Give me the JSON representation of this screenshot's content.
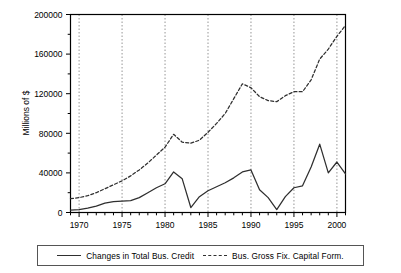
{
  "chart_data": {
    "type": "line",
    "title": "",
    "xlabel": "",
    "ylabel": "Millions of $",
    "xlim": [
      1969,
      2001
    ],
    "ylim": [
      0,
      200000
    ],
    "xticks": [
      1970,
      1975,
      1980,
      1985,
      1990,
      1995,
      2000
    ],
    "yticks": [
      0,
      40000,
      80000,
      120000,
      160000,
      200000
    ],
    "ytick_labels": [
      "0",
      "40000",
      "80000",
      "120000",
      "160000",
      "200000"
    ],
    "xtick_labels": [
      "1970",
      "1975",
      "1980",
      "1985",
      "1990",
      "1995",
      "2000"
    ],
    "grid": "vertical dotted gridlines at each x tick",
    "legend_position": "below axes, boxed, horizontal",
    "x": [
      1969,
      1970,
      1971,
      1972,
      1973,
      1974,
      1975,
      1976,
      1977,
      1978,
      1979,
      1980,
      1981,
      1982,
      1983,
      1984,
      1985,
      1986,
      1987,
      1988,
      1989,
      1990,
      1991,
      1992,
      1993,
      1994,
      1995,
      1996,
      1997,
      1998,
      1999,
      2000,
      2001
    ],
    "series": [
      {
        "name": "Changes in Total Bus. Credit",
        "style": "solid",
        "color": "#2f2f2f",
        "values": [
          2500,
          3000,
          4500,
          6500,
          9500,
          11000,
          11500,
          12000,
          15000,
          20000,
          25000,
          29000,
          41000,
          34000,
          5000,
          16000,
          22000,
          26000,
          30000,
          35000,
          41000,
          43000,
          23000,
          15000,
          3000,
          16000,
          25000,
          27000,
          46000,
          69000,
          40000,
          51000,
          39000
        ]
      },
      {
        "name": "Bus. Gross Fix. Capital Form.",
        "style": "dashed",
        "color": "#2f2f2f",
        "values": [
          14000,
          15000,
          17000,
          20000,
          24000,
          28000,
          32000,
          37000,
          43000,
          50000,
          58000,
          66000,
          79000,
          71000,
          70000,
          73000,
          81000,
          90000,
          100000,
          115000,
          130000,
          126000,
          117000,
          113000,
          112000,
          118000,
          122000,
          122000,
          134000,
          155000,
          165000,
          178000,
          189000
        ]
      }
    ]
  },
  "axis": {
    "ylabel": "Millions of $"
  },
  "legend": {
    "items": [
      {
        "label": "Changes in Total Bus. Credit",
        "style": "solid"
      },
      {
        "label": "Bus. Gross Fix. Capital Form.",
        "style": "dashed"
      }
    ]
  }
}
